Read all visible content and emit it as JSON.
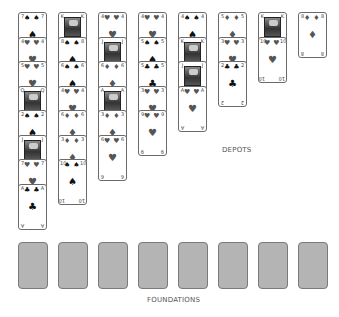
{
  "labels": {
    "depots": "DEPOTS",
    "foundations": "FOUNDATIONS"
  },
  "depots": [
    {
      "cards": [
        {
          "rank": "7",
          "suit": "♠",
          "color": "black",
          "face": false
        },
        {
          "rank": "4",
          "suit": "♥",
          "color": "red",
          "face": false
        },
        {
          "rank": "5",
          "suit": "♥",
          "color": "red",
          "face": false
        },
        {
          "rank": "Q",
          "suit": "♥",
          "color": "red",
          "face": true
        },
        {
          "rank": "2",
          "suit": "♠",
          "color": "black",
          "face": false
        },
        {
          "rank": "J",
          "suit": "♠",
          "color": "black",
          "face": true
        },
        {
          "rank": "7",
          "suit": "♥",
          "color": "red",
          "face": false
        },
        {
          "rank": "A",
          "suit": "♣",
          "color": "black",
          "face": false
        }
      ]
    },
    {
      "cards": [
        {
          "rank": "K",
          "suit": "♠",
          "color": "black",
          "face": true
        },
        {
          "rank": "8",
          "suit": "♠",
          "color": "black",
          "face": false
        },
        {
          "rank": "6",
          "suit": "♠",
          "color": "black",
          "face": false
        },
        {
          "rank": "4",
          "suit": "♥",
          "color": "red",
          "face": false
        },
        {
          "rank": "6",
          "suit": "♦",
          "color": "red",
          "face": false
        },
        {
          "rank": "3",
          "suit": "♦",
          "color": "red",
          "face": false
        },
        {
          "rank": "10",
          "suit": "♠",
          "color": "black",
          "face": false
        }
      ]
    },
    {
      "cards": [
        {
          "rank": "4",
          "suit": "♥",
          "color": "red",
          "face": false
        },
        {
          "rank": "J",
          "suit": "♠",
          "color": "black",
          "face": true
        },
        {
          "rank": "6",
          "suit": "♦",
          "color": "red",
          "face": false
        },
        {
          "rank": "A",
          "suit": "♦",
          "color": "red",
          "face": true
        },
        {
          "rank": "3",
          "suit": "♦",
          "color": "red",
          "face": false
        },
        {
          "rank": "6",
          "suit": "♥",
          "color": "red",
          "face": false
        }
      ]
    },
    {
      "cards": [
        {
          "rank": "4",
          "suit": "♥",
          "color": "red",
          "face": false
        },
        {
          "rank": "5",
          "suit": "♠",
          "color": "black",
          "face": false
        },
        {
          "rank": "5",
          "suit": "♣",
          "color": "black",
          "face": false
        },
        {
          "rank": "3",
          "suit": "♥",
          "color": "red",
          "face": false
        },
        {
          "rank": "9",
          "suit": "♥",
          "color": "red",
          "face": false
        }
      ]
    },
    {
      "cards": [
        {
          "rank": "4",
          "suit": "♠",
          "color": "black",
          "face": false
        },
        {
          "rank": "K",
          "suit": "♠",
          "color": "black",
          "face": true
        },
        {
          "rank": "J",
          "suit": "♣",
          "color": "black",
          "face": true
        },
        {
          "rank": "A",
          "suit": "♥",
          "color": "red",
          "face": false
        }
      ]
    },
    {
      "cards": [
        {
          "rank": "5",
          "suit": "♦",
          "color": "red",
          "face": false
        },
        {
          "rank": "3",
          "suit": "♥",
          "color": "red",
          "face": false
        },
        {
          "rank": "2",
          "suit": "♣",
          "color": "black",
          "face": false
        }
      ]
    },
    {
      "cards": [
        {
          "rank": "K",
          "suit": "♣",
          "color": "black",
          "face": true
        },
        {
          "rank": "10",
          "suit": "♥",
          "color": "red",
          "face": false
        }
      ]
    },
    {
      "cards": [
        {
          "rank": "8",
          "suit": "♦",
          "color": "red",
          "face": false
        }
      ]
    }
  ],
  "foundations": [
    {
      "empty": true
    },
    {
      "empty": true
    },
    {
      "empty": true
    },
    {
      "empty": true
    },
    {
      "empty": true
    },
    {
      "empty": true
    },
    {
      "empty": true
    },
    {
      "empty": true
    }
  ],
  "colors": {
    "foundation_fill": "#b4b4b4",
    "card_border": "#6a6a6a",
    "label": "#555555"
  }
}
